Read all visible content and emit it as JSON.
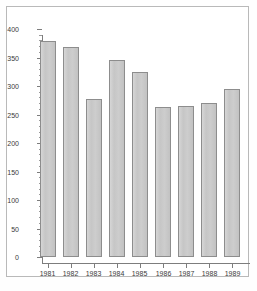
{
  "chart_data": {
    "type": "bar",
    "title": "",
    "subtitle": "",
    "xlabel": "",
    "ylabel": "",
    "categories": [
      "1981",
      "1982",
      "1983",
      "1984",
      "1985",
      "1986",
      "1987",
      "1988",
      "1989"
    ],
    "values": [
      379,
      368,
      278,
      345,
      325,
      264,
      265,
      270,
      295
    ],
    "ylim": [
      0,
      400
    ],
    "ytick_labels": [
      "0",
      "50",
      "100",
      "150",
      "200",
      "250",
      "300",
      "350",
      "400"
    ],
    "ytick_values": [
      0,
      50,
      100,
      150,
      200,
      250,
      300,
      350,
      400
    ],
    "yminor_step": 10,
    "grid": false,
    "legend": "none",
    "bar_color": "#c9c9c9",
    "bar_border_color": "#8d8d8d",
    "axis_color": "#7d7d7d",
    "text_color": "#3a3a3a",
    "background": "#ffffff",
    "frame_border_color": "#b9b9b9"
  }
}
